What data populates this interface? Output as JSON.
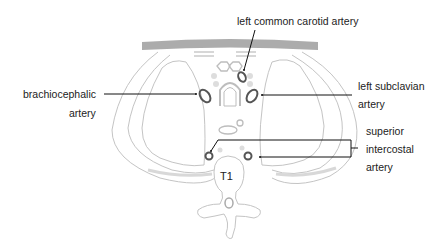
{
  "diagram": {
    "type": "anatomical cross-section",
    "vertebra_label": "T1",
    "labels": {
      "left_common_carotid": "left common carotid artery",
      "brachiocephalic_line1": "brachiocephalic",
      "brachiocephalic_line2": "artery",
      "left_subclavian_line1": "left subclavian",
      "left_subclavian_line2": "artery",
      "superior_intercostal_line1": "superior",
      "superior_intercostal_line2": "intercostal",
      "superior_intercostal_line3": "artery"
    },
    "colors": {
      "outline": "#bdbdbd",
      "sternum_band": "#9e9e9e",
      "artery": "#555555",
      "leader": "#111111",
      "text": "#222222",
      "faint_dot": "#dddddd"
    }
  }
}
